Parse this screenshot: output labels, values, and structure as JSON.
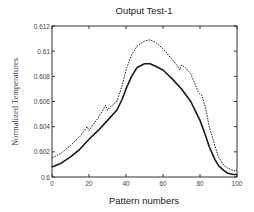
{
  "chart_data": {
    "type": "line",
    "title": "Output Test-1",
    "xlabel": "Pattern numbers",
    "ylabel": "Normalized Temperatures",
    "xlim": [
      0,
      100
    ],
    "ylim": [
      0.6,
      0.612
    ],
    "xticks": [
      0,
      20,
      40,
      60,
      80,
      100
    ],
    "xtick_labels": [
      "0",
      "20",
      "40",
      "60",
      "80",
      "100"
    ],
    "yticks": [
      0.6,
      0.602,
      0.604,
      0.606,
      0.608,
      0.61,
      0.612
    ],
    "ytick_labels": [
      "0.6",
      "0.602",
      "0.604",
      "0.606",
      "0.608",
      "0.61",
      "0.612"
    ],
    "grid": false,
    "legend": "none",
    "series": [
      {
        "name": "solid",
        "style": "solid",
        "color": "#1a1a1a",
        "x": [
          0,
          5,
          10,
          15,
          20,
          25,
          30,
          35,
          38,
          40,
          43,
          46,
          50,
          53,
          56,
          60,
          65,
          70,
          75,
          78,
          80,
          83,
          85,
          88,
          90,
          93,
          95,
          98,
          100
        ],
        "y": [
          0.6008,
          0.6011,
          0.6016,
          0.6022,
          0.603,
          0.6037,
          0.6045,
          0.6053,
          0.6062,
          0.607,
          0.608,
          0.6087,
          0.609,
          0.609,
          0.6088,
          0.6085,
          0.6078,
          0.607,
          0.606,
          0.6051,
          0.6045,
          0.6033,
          0.6024,
          0.6014,
          0.6009,
          0.6005,
          0.6003,
          0.6002,
          0.6002
        ]
      },
      {
        "name": "dotted",
        "style": "dotted",
        "color": "#1a1a1a",
        "x": [
          0,
          5,
          10,
          15,
          19,
          20,
          21,
          25,
          29,
          30,
          31,
          35,
          38,
          40,
          43,
          46,
          50,
          53,
          56,
          60,
          64,
          68,
          69,
          70,
          72,
          75,
          79,
          80,
          81,
          83,
          85,
          88,
          90,
          93,
          95,
          98,
          100
        ],
        "y": [
          0.6015,
          0.6019,
          0.6025,
          0.6032,
          0.604,
          0.6037,
          0.6039,
          0.6047,
          0.6057,
          0.6053,
          0.6055,
          0.606,
          0.6073,
          0.6085,
          0.6097,
          0.6104,
          0.6108,
          0.6109,
          0.6107,
          0.6102,
          0.6095,
          0.6088,
          0.6085,
          0.6089,
          0.6087,
          0.6082,
          0.6068,
          0.6066,
          0.6065,
          0.6055,
          0.604,
          0.6025,
          0.6016,
          0.6009,
          0.6007,
          0.6005,
          0.6005
        ]
      }
    ]
  }
}
